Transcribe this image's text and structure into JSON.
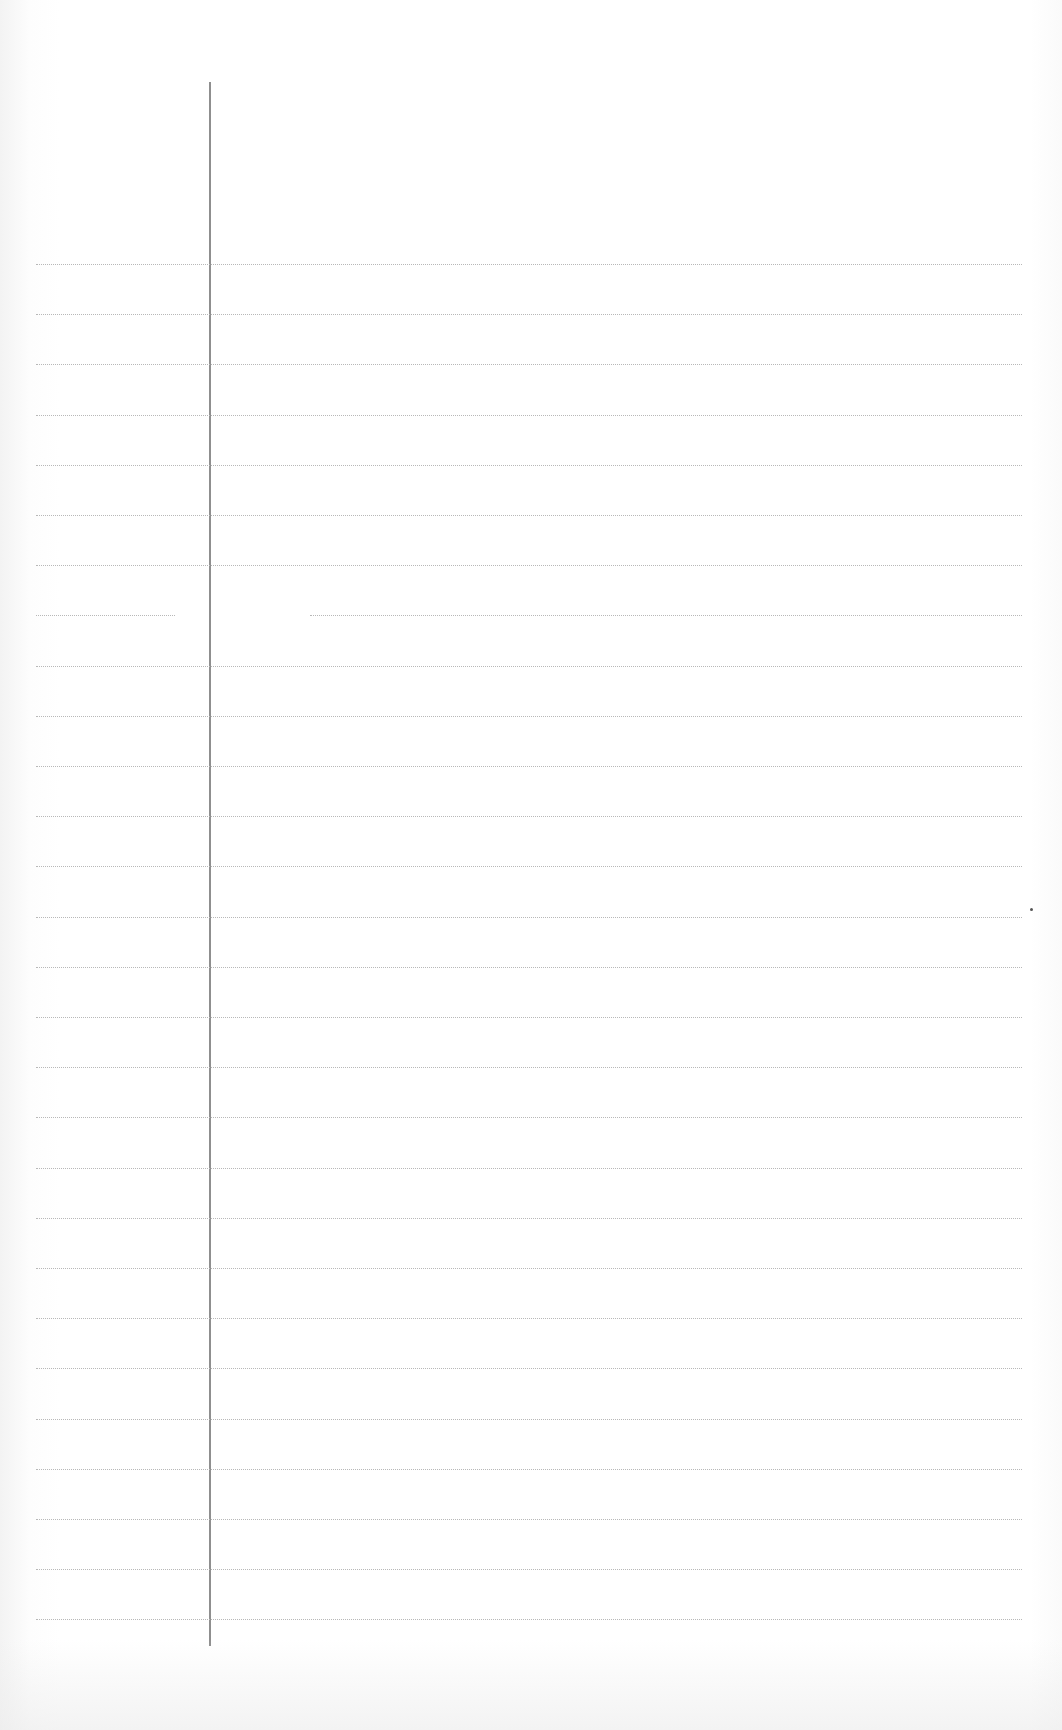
{
  "page": {
    "type": "lined-notebook-page",
    "content_text": "",
    "colors": {
      "paper": "#ffffff",
      "rule_line": "#b8b8b8",
      "margin_line": "#8f8f8f"
    },
    "margin_line": {
      "x": 209,
      "top": 82,
      "bottom": 1646
    },
    "rules": {
      "count": 28,
      "first_y": 264,
      "spacing": 50.2,
      "left_x": 36,
      "right_x": 1022,
      "broken_line_index": 7,
      "broken_segments": [
        [
          36,
          175
        ],
        [
          310,
          1022
        ]
      ]
    },
    "specks": [
      {
        "x": 1030,
        "y": 908
      }
    ]
  }
}
